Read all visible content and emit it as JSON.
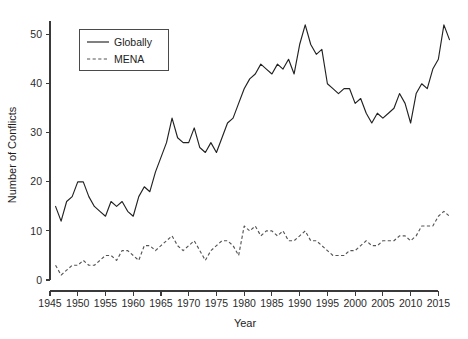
{
  "chart_data": {
    "type": "line",
    "title": "",
    "xlabel": "Year",
    "ylabel": "Number of Conflicts",
    "xlim": [
      1945,
      2018
    ],
    "ylim": [
      0,
      53
    ],
    "grid": false,
    "legend_position": "top-left-inside",
    "xticks": [
      1945,
      1950,
      1955,
      1960,
      1965,
      1970,
      1975,
      1980,
      1985,
      1990,
      1995,
      2000,
      2005,
      2010,
      2015
    ],
    "yticks": [
      0,
      10,
      20,
      30,
      40,
      50
    ],
    "x": [
      1946,
      1947,
      1948,
      1949,
      1950,
      1951,
      1952,
      1953,
      1954,
      1955,
      1956,
      1957,
      1958,
      1959,
      1960,
      1961,
      1962,
      1963,
      1964,
      1965,
      1966,
      1967,
      1968,
      1969,
      1970,
      1971,
      1972,
      1973,
      1974,
      1975,
      1976,
      1977,
      1978,
      1979,
      1980,
      1981,
      1982,
      1983,
      1984,
      1985,
      1986,
      1987,
      1988,
      1989,
      1990,
      1991,
      1992,
      1993,
      1994,
      1995,
      1996,
      1997,
      1998,
      1999,
      2000,
      2001,
      2002,
      2003,
      2004,
      2005,
      2006,
      2007,
      2008,
      2009,
      2010,
      2011,
      2012,
      2013,
      2014,
      2015,
      2016,
      2017
    ],
    "series": [
      {
        "name": "Globally",
        "style": "solid",
        "color": "#222222",
        "values": [
          15,
          12,
          16,
          17,
          20,
          20,
          17,
          15,
          14,
          13,
          16,
          15,
          16,
          14,
          13,
          17,
          19,
          18,
          22,
          25,
          28,
          33,
          29,
          28,
          28,
          31,
          27,
          26,
          28,
          26,
          29,
          32,
          33,
          36,
          39,
          41,
          42,
          44,
          43,
          42,
          44,
          43,
          45,
          42,
          48,
          52,
          48,
          46,
          47,
          40,
          39,
          38,
          39,
          39,
          36,
          37,
          34,
          32,
          34,
          33,
          34,
          35,
          38,
          36,
          32,
          38,
          40,
          39,
          43,
          45,
          52,
          49
        ]
      },
      {
        "name": "MENA",
        "style": "dashed",
        "color": "#555555",
        "values": [
          3,
          1,
          2,
          3,
          3,
          4,
          3,
          3,
          4,
          5,
          5,
          4,
          6,
          6,
          5,
          4,
          7,
          7,
          6,
          7,
          8,
          9,
          7,
          6,
          7,
          8,
          6,
          4,
          6,
          7,
          8,
          8,
          7,
          5,
          11,
          10,
          11,
          9,
          10,
          10,
          9,
          10,
          8,
          8,
          9,
          10,
          8,
          8,
          7,
          6,
          5,
          5,
          5,
          6,
          6,
          7,
          8,
          7,
          7,
          8,
          8,
          8,
          9,
          9,
          8,
          9,
          11,
          11,
          11,
          13,
          14,
          13
        ]
      }
    ],
    "legend": [
      {
        "label": "Globally",
        "style": "solid"
      },
      {
        "label": "MENA",
        "style": "dashed"
      }
    ]
  }
}
